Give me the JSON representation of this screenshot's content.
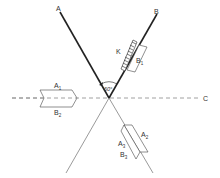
{
  "diagram": {
    "lines": {
      "A": {
        "label": "A"
      },
      "B": {
        "label": "B"
      },
      "C": {
        "label": "C"
      }
    },
    "angle": {
      "label": "60°"
    },
    "hatched_block": {
      "label": "K"
    },
    "box_b1": {
      "label": "B",
      "sub": "1"
    },
    "left_arrow": {
      "top_label": "A",
      "top_sub": "1",
      "bottom_label": "B",
      "bottom_sub": "2"
    },
    "lower_box": {
      "a2_label": "A",
      "a2_sub": "2",
      "a3_label": "A",
      "a3_sub": "3",
      "b3_label": "B",
      "b3_sub": "3"
    },
    "colors": {
      "line": "#222222",
      "thin_line": "#555555",
      "dashed": "#888888",
      "text": "#333333"
    }
  }
}
